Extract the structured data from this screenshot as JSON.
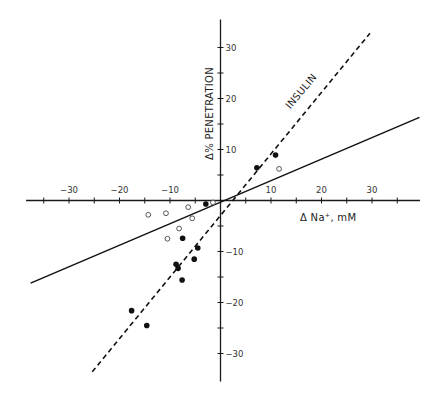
{
  "chart_data": {
    "type": "scatter",
    "title": "",
    "xlabel": "Δ Na⁺, mM",
    "ylabel": "Δ% PENETRATION",
    "xlim": [
      -40,
      40
    ],
    "ylim": [
      -35,
      35
    ],
    "grid": false,
    "x_ticks": [
      -30,
      -20,
      -10,
      10,
      20,
      30
    ],
    "x_minor_ticks": [
      -35,
      -25,
      -15,
      -5,
      5,
      15,
      25,
      35
    ],
    "y_ticks": [
      -30,
      -20,
      -10,
      10,
      20,
      30
    ],
    "y_minor_ticks": [
      -25,
      -15,
      -5,
      5,
      15,
      25
    ],
    "annotations": [
      {
        "text": "INSULIN",
        "x": 13,
        "y": 19,
        "rotation": -50
      }
    ],
    "series": [
      {
        "name": "filled",
        "marker": "filled-circle",
        "points": [
          [
            -2.9,
            -0.7
          ],
          [
            7.2,
            6.4
          ],
          [
            10.9,
            8.9
          ],
          [
            -7.5,
            -7.4
          ],
          [
            -4.5,
            -9.3
          ],
          [
            -5.2,
            -11.5
          ],
          [
            -8.8,
            -12.5
          ],
          [
            -8.4,
            -13.3
          ],
          [
            -7.6,
            -15.6
          ],
          [
            -17.6,
            -21.6
          ],
          [
            -14.6,
            -24.5
          ]
        ]
      },
      {
        "name": "open",
        "marker": "open-circle",
        "points": [
          [
            -14.3,
            -2.8
          ],
          [
            -10.8,
            -2.5
          ],
          [
            -6.4,
            -1.3
          ],
          [
            -5.6,
            -3.5
          ],
          [
            -8.2,
            -5.5
          ],
          [
            -10.5,
            -7.5
          ],
          [
            -1.5,
            -0.4
          ],
          [
            11.6,
            6.2
          ]
        ]
      }
    ],
    "lines": [
      {
        "name": "insulin-regression",
        "style": "dashed",
        "from": [
          -25.4,
          -33.6
        ],
        "to": [
          29.6,
          32.8
        ]
      },
      {
        "name": "control-regression",
        "style": "solid",
        "from": [
          -37.6,
          -16.2
        ],
        "to": [
          39.4,
          16.3
        ]
      }
    ],
    "axis_extent": {
      "x": [
        -38.5,
        39.5
      ],
      "y": [
        -35.5,
        35.5
      ]
    }
  }
}
